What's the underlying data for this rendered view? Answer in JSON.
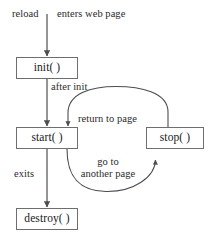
{
  "diagram": {
    "type": "state-transition-diagram",
    "background_color": "#ffffff",
    "stroke_color": "#4d4d4d",
    "box_border_color": "#6e6e6e",
    "text_color": "#1a1a1a",
    "nodes": [
      {
        "id": "init",
        "label": "init( )",
        "x": 16,
        "y": 57,
        "width": 62,
        "height": 22
      },
      {
        "id": "start",
        "label": "start( )",
        "x": 16,
        "y": 127,
        "width": 62,
        "height": 22
      },
      {
        "id": "stop",
        "label": "stop( )",
        "x": 146,
        "y": 127,
        "width": 58,
        "height": 22
      },
      {
        "id": "destroy",
        "label": "destroy( )",
        "x": 16,
        "y": 208,
        "width": 62,
        "height": 22
      }
    ],
    "edges": [
      {
        "id": "edge-reload",
        "from": "external",
        "to": "init",
        "label": "reload",
        "shape": "straight-down"
      },
      {
        "id": "edge-enters-web-page",
        "from": "external",
        "to": "init",
        "label": "enters web page",
        "shape": "straight-down"
      },
      {
        "id": "edge-after-init",
        "from": "init",
        "to": "start",
        "label": "after init",
        "shape": "straight-down"
      },
      {
        "id": "edge-exits",
        "from": "start",
        "to": "destroy",
        "label": "exits",
        "shape": "straight-down"
      },
      {
        "id": "edge-return-to-page",
        "from": "stop",
        "to": "start",
        "label": "return to page",
        "shape": "curve-top"
      },
      {
        "id": "edge-go-to-another-page",
        "from": "start",
        "to": "stop",
        "label_line1": "go to",
        "label_line2": "another page",
        "shape": "curve-bottom"
      }
    ],
    "labels": {
      "reload": "reload",
      "enters_web_page": "enters web page",
      "after_init": "after init",
      "exits": "exits",
      "return_to_page": "return to page",
      "go_to_line1": "go to",
      "go_to_line2": "another page"
    }
  }
}
